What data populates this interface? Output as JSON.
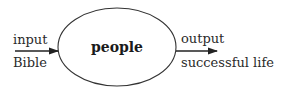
{
  "diagram": {
    "center_node": {
      "label": "people"
    },
    "input": {
      "label_top": "input",
      "label_bottom": "Bible"
    },
    "output": {
      "label_top": "output",
      "label_bottom": "successful life"
    },
    "colors": {
      "stroke": "#333333",
      "text": "#2a2a2a"
    }
  }
}
